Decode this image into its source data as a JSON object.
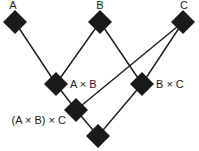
{
  "diagram": {
    "title": "",
    "colors": {
      "node": "#1a1a1a",
      "edge": "#1a1a1a",
      "background": "#ffffff"
    },
    "nodes": [
      {
        "id": "A",
        "label": "A",
        "x": 15,
        "y": 22
      },
      {
        "id": "B",
        "label": "B",
        "x": 100,
        "y": 22
      },
      {
        "id": "C",
        "label": "C",
        "x": 183,
        "y": 22
      },
      {
        "id": "AxB",
        "label": "A × B",
        "x": 56,
        "y": 84
      },
      {
        "id": "BxC",
        "label": "B × C",
        "x": 142,
        "y": 84
      },
      {
        "id": "AxBxC",
        "label": "(A × B) × C",
        "x": 76,
        "y": 110
      },
      {
        "id": "bottom",
        "label": "",
        "x": 98,
        "y": 136
      }
    ],
    "edges": [
      {
        "from": "A",
        "to": "AxB"
      },
      {
        "from": "B",
        "to": "AxB"
      },
      {
        "from": "B",
        "to": "BxC"
      },
      {
        "from": "C",
        "to": "BxC"
      },
      {
        "from": "C",
        "to": "AxBxC"
      },
      {
        "from": "AxB",
        "to": "AxBxC"
      },
      {
        "from": "AxBxC",
        "to": "bottom"
      },
      {
        "from": "BxC",
        "to": "bottom"
      }
    ]
  }
}
